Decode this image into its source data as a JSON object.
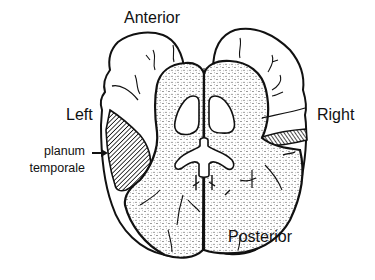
{
  "diagram": {
    "type": "anatomical-illustration",
    "labels": {
      "anterior": "Anterior",
      "posterior": "Posterior",
      "left": "Left",
      "right": "Right",
      "planum_line1": "planum",
      "planum_line2": "temporale"
    },
    "annotations": [
      {
        "text": "planum temporale",
        "points_to": "left hatched region",
        "marker": "arrow"
      }
    ],
    "colors": {
      "ink": "#111111",
      "background": "#ffffff"
    }
  }
}
